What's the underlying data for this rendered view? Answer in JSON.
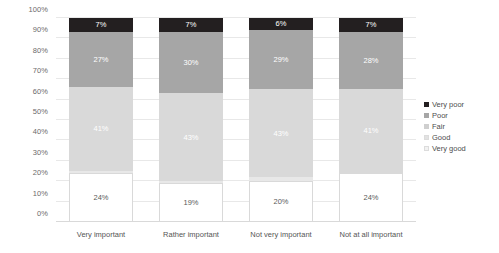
{
  "chart_data": {
    "type": "bar",
    "variant": "stacked-100-percent",
    "title": "",
    "xlabel": "",
    "ylabel": "",
    "ylim": [
      0,
      100
    ],
    "ytick_labels": [
      "0%",
      "10%",
      "20%",
      "30%",
      "40%",
      "50%",
      "60%",
      "70%",
      "80%",
      "90%",
      "100%"
    ],
    "ytick_values": [
      0,
      10,
      20,
      30,
      40,
      50,
      60,
      70,
      80,
      90,
      100
    ],
    "grid": true,
    "legend_position": "right",
    "categories": [
      "Very important",
      "Rather important",
      "Not very important",
      "Not at all important"
    ],
    "series": [
      {
        "name": "Very poor",
        "color": "#231f20",
        "values": [
          7,
          7,
          6,
          7
        ],
        "labels": [
          "7%",
          "7%",
          "6%",
          "7%"
        ]
      },
      {
        "name": "Poor",
        "color": "#a6a6a6",
        "values": [
          27,
          30,
          29,
          28
        ],
        "labels": [
          "27%",
          "30%",
          "29%",
          "28%"
        ]
      },
      {
        "name": "Fair",
        "color": "#d9d9d9",
        "values": [
          41,
          43,
          43,
          41
        ],
        "labels": [
          "41%",
          "43%",
          "43%",
          "41%"
        ]
      },
      {
        "name": "Good",
        "color": "#e8e8e8",
        "values": [
          1,
          1,
          2,
          0
        ],
        "labels": [
          "",
          "",
          "",
          ""
        ]
      },
      {
        "name": "Very good",
        "color": "#ffffff",
        "values": [
          24,
          19,
          20,
          24
        ],
        "labels": [
          "24%",
          "19%",
          "20%",
          "24%"
        ]
      }
    ]
  },
  "legend": {
    "items": [
      {
        "label": "Very poor",
        "color": "#231f20"
      },
      {
        "label": "Poor",
        "color": "#a6a6a6"
      },
      {
        "label": "Fair",
        "color": "#cfcfcf"
      },
      {
        "label": "Good",
        "color": "#e2e2e2"
      },
      {
        "label": "Very good",
        "color": "#f2f2f2"
      }
    ]
  },
  "colors": {
    "gridline": "#e8e8e8",
    "axis_text": "#6b6b6b",
    "category_text": "#555555",
    "legend_text": "#4d4d4d",
    "background": "#ffffff"
  }
}
